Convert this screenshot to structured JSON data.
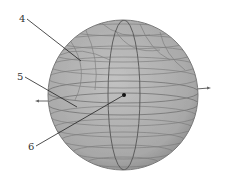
{
  "figure": {
    "colors": {
      "background": "#ffffff",
      "sphere_fill": "#b4b4b4",
      "sphere_shade": "#8c8c8c",
      "winding_lines": "#6e6e6e",
      "leader_lines": "#222222",
      "label_text": "#333333"
    },
    "sphere": {
      "cx": 123,
      "cy": 95,
      "r": 75
    },
    "axis_arrows": [
      {
        "name": "left-axis-arrow",
        "x1": 50,
        "y1": 101,
        "x2": 36,
        "y2": 101
      },
      {
        "name": "right-axis-arrow",
        "x1": 196,
        "y1": 89,
        "x2": 210,
        "y2": 88
      }
    ],
    "center_point": {
      "x": 124,
      "y": 95
    },
    "callouts": [
      {
        "id": "4",
        "text": "4",
        "tx": 20,
        "ty": 22,
        "x1": 27,
        "y1": 19,
        "x2": 81,
        "y2": 61
      },
      {
        "id": "5",
        "text": "5",
        "tx": 18,
        "ty": 80,
        "x1": 25,
        "y1": 77,
        "x2": 77,
        "y2": 107
      },
      {
        "id": "6",
        "text": "6",
        "tx": 29,
        "ty": 150,
        "x1": 36,
        "y1": 146,
        "x2": 124,
        "y2": 95
      }
    ]
  }
}
